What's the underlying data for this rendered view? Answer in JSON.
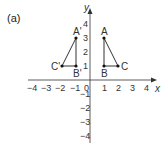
{
  "part_label": "(a)",
  "axes": {
    "x_label": "x",
    "y_label": "y",
    "x_ticks": [
      "−4",
      "−3",
      "−2",
      "−1",
      "0",
      "1",
      "2",
      "3",
      "4"
    ],
    "y_ticks_pos": [
      "1",
      "2",
      "3",
      "4"
    ],
    "y_ticks_neg": [
      "−1",
      "−2",
      "−3",
      "−4"
    ],
    "xlim": [
      -4,
      4
    ],
    "ylim": [
      -4,
      4
    ]
  },
  "shapes": {
    "original": {
      "name": "triangle ABC",
      "points": [
        {
          "label": "A",
          "x": 1,
          "y": 3
        },
        {
          "label": "B",
          "x": 1,
          "y": 1
        },
        {
          "label": "C",
          "x": 2,
          "y": 1
        }
      ]
    },
    "image": {
      "name": "triangle A'B'C'",
      "points": [
        {
          "label": "A'",
          "x": -1,
          "y": 3
        },
        {
          "label": "B'",
          "x": -1,
          "y": 1
        },
        {
          "label": "C'",
          "x": -2,
          "y": 1
        }
      ]
    }
  },
  "colors": {
    "line": "#333333",
    "point": "#111111",
    "text": "#333333"
  }
}
